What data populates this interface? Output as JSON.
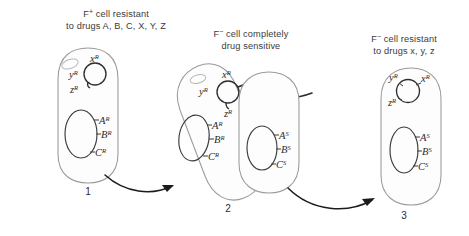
{
  "figure": {
    "background_color": "#ffffff",
    "ink_color": "#2b2b2b",
    "membrane_color": "#9a9a9a"
  },
  "captions": {
    "cell1": {
      "line1_prefix": "F",
      "line1_sup": "+",
      "line1_rest": " cell resistant",
      "line2": "to drugs A, B, C, X, Y, Z",
      "full": "F+ cell resistant to drugs A, B, C, X, Y, Z"
    },
    "cell2": {
      "line1_prefix": "F",
      "line1_sup": "−",
      "line1_rest": " cell completely",
      "line2": "drug sensitive",
      "full": "F- cell completely drug sensitive"
    },
    "cell3": {
      "line1_prefix": "F",
      "line1_sup": "−",
      "line1_rest": " cell resistant",
      "line2": "to drugs x, y, z",
      "full": "F- cell resistant to drugs x, y, z"
    }
  },
  "numbers": {
    "step1": "1",
    "step2": "2",
    "step3": "3"
  },
  "cells": {
    "cell1": {
      "name": "donor-cell",
      "plasmid_genes": [
        {
          "letter": "x",
          "state": "R"
        },
        {
          "letter": "y",
          "state": "R"
        },
        {
          "letter": "z",
          "state": "R"
        }
      ],
      "chromosome_genes": [
        {
          "letter": "A",
          "state": "R"
        },
        {
          "letter": "B",
          "state": "R"
        },
        {
          "letter": "C",
          "state": "R"
        }
      ]
    },
    "cell2_donor": {
      "name": "conjugating-donor-cell",
      "plasmid_genes": [
        {
          "letter": "x",
          "state": "R"
        },
        {
          "letter": "y",
          "state": "R"
        },
        {
          "letter": "z",
          "state": "R"
        }
      ],
      "chromosome_genes": [
        {
          "letter": "A",
          "state": "R"
        },
        {
          "letter": "B",
          "state": "R"
        },
        {
          "letter": "C",
          "state": "R"
        }
      ]
    },
    "cell2_recipient": {
      "name": "conjugating-recipient-cell",
      "plasmid_genes": [],
      "chromosome_genes": [
        {
          "letter": "A",
          "state": "S"
        },
        {
          "letter": "B",
          "state": "S"
        },
        {
          "letter": "C",
          "state": "S"
        }
      ]
    },
    "cell3": {
      "name": "transconjugant-cell",
      "plasmid_genes": [
        {
          "letter": "y",
          "state": "R"
        },
        {
          "letter": "x",
          "state": "R"
        },
        {
          "letter": "z",
          "state": "R"
        }
      ],
      "chromosome_genes": [
        {
          "letter": "A",
          "state": "S"
        },
        {
          "letter": "B",
          "state": "S"
        },
        {
          "letter": "C",
          "state": "S"
        }
      ]
    }
  },
  "gene_text": {
    "cell1_plasmid_x": "x",
    "cell1_plasmid_x_sup": "R",
    "cell1_plasmid_y": "y",
    "cell1_plasmid_y_sup": "R",
    "cell1_plasmid_z": "z",
    "cell1_plasmid_z_sup": "R",
    "cell1_chrom_a": "A",
    "cell1_chrom_a_sup": "R",
    "cell1_chrom_b": "B",
    "cell1_chrom_b_sup": "R",
    "cell1_chrom_c": "C",
    "cell1_chrom_c_sup": "R",
    "cell2_plasmid_x": "x",
    "cell2_plasmid_x_sup": "R",
    "cell2_plasmid_y": "y",
    "cell2_plasmid_y_sup": "R",
    "cell2_plasmid_z": "z",
    "cell2_plasmid_z_sup": "R",
    "cell2_chrom_a": "A",
    "cell2_chrom_a_sup": "R",
    "cell2_chrom_b": "B",
    "cell2_chrom_b_sup": "R",
    "cell2_chrom_c": "C",
    "cell2_chrom_c_sup": "R",
    "cell2r_chrom_a": "A",
    "cell2r_chrom_a_sup": "S",
    "cell2r_chrom_b": "B",
    "cell2r_chrom_b_sup": "S",
    "cell2r_chrom_c": "C",
    "cell2r_chrom_c_sup": "S",
    "cell3_plasmid_y": "y",
    "cell3_plasmid_y_sup": "R",
    "cell3_plasmid_x": "x",
    "cell3_plasmid_x_sup": "R",
    "cell3_plasmid_z": "z",
    "cell3_plasmid_z_sup": "R",
    "cell3_chrom_a": "A",
    "cell3_chrom_a_sup": "S",
    "cell3_chrom_b": "B",
    "cell3_chrom_b_sup": "S",
    "cell3_chrom_c": "C",
    "cell3_chrom_c_sup": "S"
  }
}
